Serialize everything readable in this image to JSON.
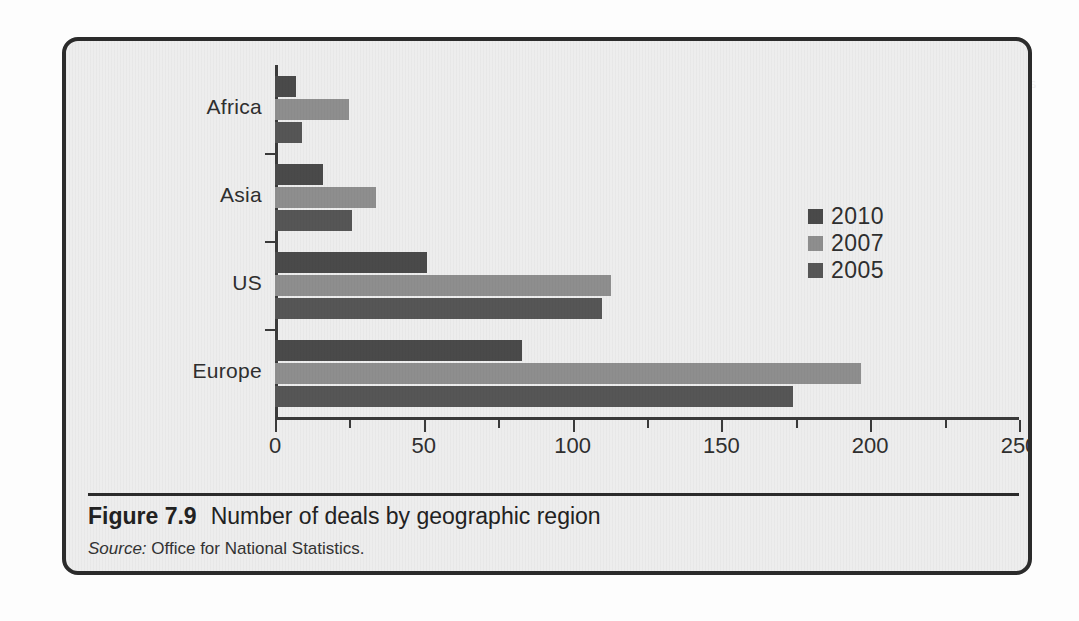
{
  "figure": {
    "caption_number": "Figure 7.9",
    "caption_title": "Number of deals by geographic region",
    "source_label": "Source:",
    "source_text": "Office for National Statistics."
  },
  "colors": {
    "series_2010": "#4a4a4a",
    "series_2007": "#8e8e8e",
    "series_2005": "#565656",
    "axis": "#3a3a3a",
    "frame": "#2b2b2b",
    "plot_background": "#ededed"
  },
  "ghost_lines": [
    "an increased million tonnes, then 30% of the population",
    "was believed themselves with the signing of",
    "provide a key per cent As an economy internation",
    "new) multinationals scale and trade flows over",
    "million towards",
    "disable new important concluded so impact that the",
    "balance of payments deteriorates following the trade",
    "of increase in power 7.12 looks at much of the size of",
    "these firms dependence upon the management skills",
    "and in the asset deals the general categories",
    "mainstream so access Asian factors deals across",
    "terms. Since the early 1990s, the number of cross-",
    "border deals peaked at approximately double the",
    "preceding level in most advanced economies and",
    "this has remained so through the period of the rest"
  ],
  "chart_data": {
    "type": "bar",
    "orientation": "horizontal",
    "title": "Number of deals by geographic region",
    "xlabel": "",
    "ylabel": "",
    "categories": [
      "Africa",
      "Asia",
      "US",
      "Europe"
    ],
    "series": [
      {
        "name": "2010",
        "color": "#4a4a4a",
        "values": [
          7,
          16,
          51,
          83
        ]
      },
      {
        "name": "2007",
        "color": "#8e8e8e",
        "values": [
          25,
          34,
          113,
          197
        ]
      },
      {
        "name": "2005",
        "color": "#565656",
        "values": [
          9,
          26,
          110,
          174
        ]
      }
    ],
    "xlim": [
      0,
      250
    ],
    "xticks": [
      0,
      50,
      100,
      150,
      200,
      250
    ],
    "xtick_labels": [
      "0",
      "50",
      "100",
      "150",
      "200",
      "250"
    ],
    "xminor_ticks": [
      25,
      75,
      125,
      175,
      225
    ],
    "grid": false,
    "legend_position": "right",
    "legend_entries": [
      "2010",
      "2007",
      "2005"
    ]
  }
}
